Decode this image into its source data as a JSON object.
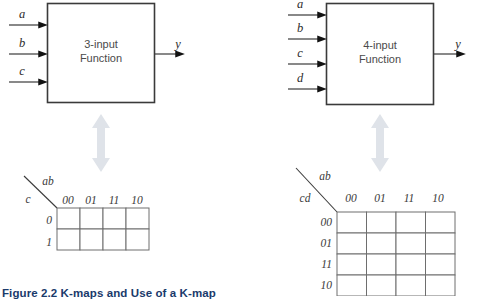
{
  "figure": {
    "caption": "Figure 2.2 K-maps and Use of a K-map",
    "caption_color": "#1a3a6b",
    "background": "#ffffff",
    "line_color": "#3a3a3a",
    "arrow_color": "#d9dde3",
    "text_color": "#4a4a4a"
  },
  "panels": [
    {
      "id": "three-input",
      "block": {
        "label_line1": "3-input",
        "label_line2": "Function",
        "inputs": [
          "a",
          "b",
          "c"
        ],
        "output": "y"
      },
      "kmap": {
        "col_var": "ab",
        "row_var": "c",
        "col_headers": [
          "00",
          "01",
          "11",
          "10"
        ],
        "row_headers": [
          "0",
          "1"
        ],
        "cells": [
          [
            "",
            "",
            "",
            ""
          ],
          [
            "",
            "",
            "",
            ""
          ]
        ]
      },
      "connector": "double-arrow-vertical"
    },
    {
      "id": "four-input",
      "block": {
        "label_line1": "4-input",
        "label_line2": "Function",
        "inputs": [
          "a",
          "b",
          "c",
          "d"
        ],
        "output": "y"
      },
      "kmap": {
        "col_var": "ab",
        "row_var": "cd",
        "col_headers": [
          "00",
          "01",
          "11",
          "10"
        ],
        "row_headers": [
          "00",
          "01",
          "11",
          "10"
        ],
        "cells": [
          [
            "",
            "",
            "",
            ""
          ],
          [
            "",
            "",
            "",
            ""
          ],
          [
            "",
            "",
            "",
            ""
          ],
          [
            "",
            "",
            "",
            ""
          ]
        ]
      },
      "connector": "double-arrow-vertical"
    }
  ]
}
